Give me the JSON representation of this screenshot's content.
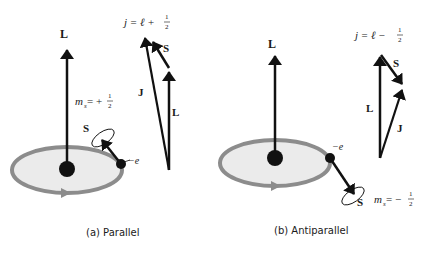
{
  "panels": {
    "parallel": {
      "caption": "(a) Parallel",
      "orbit_L_label": "L",
      "spin_label": "S",
      "electron_label": "−e",
      "ms_label": "m",
      "ms_sub": "s",
      "ms_value": " = +",
      "ms_num": "1",
      "ms_den": "2",
      "vector_sum_eq": "j = ℓ + ",
      "vector_sum_num": "1",
      "vector_sum_den": "2",
      "sum_S": "S",
      "sum_J": "J",
      "sum_L": "L"
    },
    "antiparallel": {
      "caption": "(b) Antiparallel",
      "orbit_L_label": "L",
      "spin_label": "S",
      "electron_label": "−e",
      "ms_label": "m",
      "ms_sub": "s",
      "ms_value": " = −",
      "ms_num": "1",
      "ms_den": "2",
      "vector_sum_eq": "j = ℓ − ",
      "vector_sum_num": "1",
      "vector_sum_den": "2",
      "sum_S": "S",
      "sum_J": "J",
      "sum_L": "L"
    }
  },
  "colors": {
    "orbit_stroke": "#8c8c8c",
    "orbit_fill": "#ebebeb",
    "vector": "#111111"
  }
}
